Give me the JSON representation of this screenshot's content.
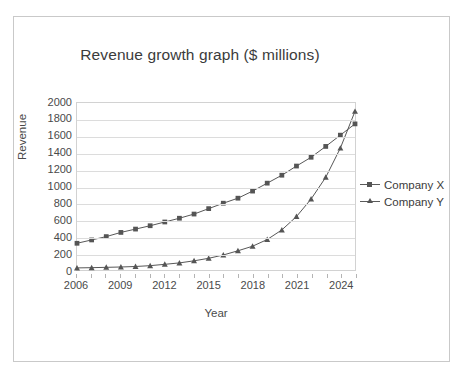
{
  "chart_data": {
    "type": "line",
    "title": "Revenue growth graph ($ millions)",
    "xlabel": "Year",
    "ylabel": "Revenue",
    "ylim": [
      0,
      2000
    ],
    "ytick_step": 200,
    "yticks": [
      "2000",
      "1800",
      "1600",
      "1400",
      "1200",
      "1000",
      "800",
      "600",
      "400",
      "200",
      "0"
    ],
    "xlim": [
      2006,
      2025
    ],
    "xticks": [
      "2006",
      "2009",
      "2012",
      "2015",
      "2018",
      "2021",
      "2024"
    ],
    "xtick_values": [
      2006,
      2009,
      2012,
      2015,
      2018,
      2021,
      2024
    ],
    "x": [
      2006,
      2007,
      2008,
      2009,
      2010,
      2011,
      2012,
      2013,
      2014,
      2015,
      2016,
      2017,
      2018,
      2019,
      2020,
      2021,
      2022,
      2023,
      2024,
      2025
    ],
    "grid": true,
    "grid_axis": "y",
    "legend_position": "right",
    "series": [
      {
        "name": "Company X",
        "marker": "square",
        "color": "#555555",
        "values": [
          320,
          360,
          400,
          450,
          490,
          530,
          575,
          620,
          670,
          735,
          800,
          860,
          945,
          1040,
          1135,
          1245,
          1350,
          1480,
          1615,
          1750
        ]
      },
      {
        "name": "Company Y",
        "marker": "triangle",
        "color": "#555555",
        "values": [
          25,
          28,
          32,
          36,
          42,
          52,
          68,
          85,
          110,
          140,
          180,
          230,
          285,
          365,
          480,
          640,
          850,
          1110,
          1460,
          1900
        ]
      }
    ]
  },
  "legend": {
    "items": [
      {
        "label": "Company X",
        "marker": "square-marker-icon"
      },
      {
        "label": "Company Y",
        "marker": "triangle-marker-icon"
      }
    ]
  },
  "colors": {
    "series_line": "#5a5a5a",
    "marker": "#555555",
    "gridline": "#dcdcdc",
    "axis": "#d2d2d2",
    "frame_border": "#c9c9c9",
    "text": "#3b3b3b",
    "tick_text": "#4a4a4a",
    "background": "#ffffff"
  }
}
